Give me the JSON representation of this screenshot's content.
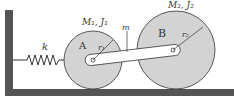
{
  "diagram": {
    "spring": {
      "label": "k"
    },
    "disk_a": {
      "name": "A",
      "mass_inertia_label": "M₁, J₁",
      "radius_label": "r₁"
    },
    "disk_b": {
      "name": "B",
      "mass_inertia_label": "M₂, J₂",
      "radius_label": "r₂"
    },
    "link": {
      "label": "m"
    },
    "colors": {
      "ground": "#555555",
      "disk_fill": "#d3d3d3",
      "stroke": "#333333",
      "link_fill": "#ffffff"
    }
  }
}
